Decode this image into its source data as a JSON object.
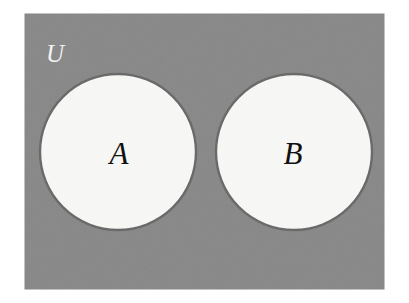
{
  "figure": {
    "kind": "venn-diagram",
    "canvas": {
      "width": 409,
      "height": 303,
      "background_color": "#ffffff"
    },
    "universe": {
      "label": "U",
      "label_color": "#f2f2f2",
      "fill_color": "#8c8c8c",
      "border_color": "#8c8c8c",
      "x": 25,
      "y": 14,
      "width": 359,
      "height": 275
    },
    "sets": [
      {
        "label": "A",
        "label_color": "#111111",
        "fill_color": "#f8f8f6",
        "stroke_color": "#6b6b6b",
        "cx": 118,
        "cy": 152,
        "r": 78
      },
      {
        "label": "B",
        "label_color": "#111111",
        "fill_color": "#f8f8f6",
        "stroke_color": "#6b6b6b",
        "cx": 294,
        "cy": 152,
        "r": 78
      }
    ],
    "relationship": "disjoint"
  }
}
